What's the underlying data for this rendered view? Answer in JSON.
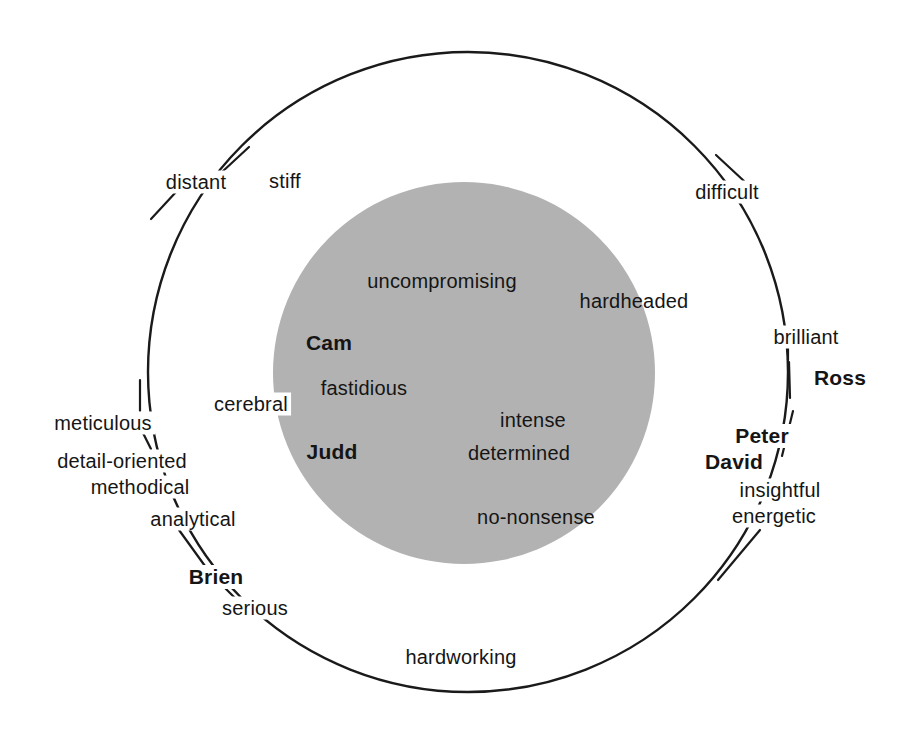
{
  "diagram": {
    "type": "venn-concentric",
    "outer_circle": {
      "name": "outer-ring",
      "cx": 468,
      "cy": 372,
      "r": 320,
      "stroke": "#1a1a1a",
      "stroke_width": 2.4,
      "fill": "none"
    },
    "inner_circle": {
      "name": "inner-core",
      "cx": 464,
      "cy": 373,
      "r": 191,
      "fill": "#b2b2b2",
      "stroke": "none"
    }
  },
  "inner_labels": [
    {
      "text": "uncompromising",
      "kind": "trait",
      "x": 442,
      "y": 281
    },
    {
      "text": "hardheaded",
      "kind": "trait",
      "x": 634,
      "y": 301
    },
    {
      "text": "Cam",
      "kind": "person",
      "x": 329,
      "y": 343
    },
    {
      "text": "fastidious",
      "kind": "trait",
      "x": 364,
      "y": 388
    },
    {
      "text": "intense",
      "kind": "trait",
      "x": 533,
      "y": 420
    },
    {
      "text": "Judd",
      "kind": "person",
      "x": 332,
      "y": 452
    },
    {
      "text": "determined",
      "kind": "trait",
      "x": 519,
      "y": 453
    },
    {
      "text": "no-nonsense",
      "kind": "trait",
      "x": 536,
      "y": 517
    }
  ],
  "ring_labels": [
    {
      "text": "distant",
      "kind": "trait",
      "x": 196,
      "y": 182
    },
    {
      "text": "stiff",
      "kind": "trait",
      "x": 285,
      "y": 181
    },
    {
      "text": "difficult",
      "kind": "trait",
      "x": 727,
      "y": 192
    },
    {
      "text": "brilliant",
      "kind": "trait",
      "x": 806,
      "y": 337
    },
    {
      "text": "Ross",
      "kind": "person",
      "x": 840,
      "y": 378
    },
    {
      "text": "cerebral",
      "kind": "trait",
      "x": 251,
      "y": 404
    },
    {
      "text": "meticulous",
      "kind": "trait",
      "x": 103,
      "y": 423
    },
    {
      "text": "Peter",
      "kind": "person",
      "x": 762,
      "y": 436
    },
    {
      "text": "detail-oriented",
      "kind": "trait",
      "x": 122,
      "y": 461
    },
    {
      "text": "David",
      "kind": "person",
      "x": 734,
      "y": 462
    },
    {
      "text": "methodical",
      "kind": "trait",
      "x": 140,
      "y": 487
    },
    {
      "text": "insightful",
      "kind": "trait",
      "x": 780,
      "y": 490
    },
    {
      "text": "analytical",
      "kind": "trait",
      "x": 193,
      "y": 519
    },
    {
      "text": "energetic",
      "kind": "trait",
      "x": 774,
      "y": 516
    },
    {
      "text": "Brien",
      "kind": "person",
      "x": 216,
      "y": 577
    },
    {
      "text": "serious",
      "kind": "trait",
      "x": 255,
      "y": 608
    },
    {
      "text": "hardworking",
      "kind": "trait",
      "x": 461,
      "y": 657
    }
  ],
  "leader_lines": [
    {
      "name": "leader-distant-up",
      "x1": 222,
      "y1": 172,
      "x2": 249,
      "y2": 147
    },
    {
      "name": "leader-distant-down",
      "x1": 176,
      "y1": 192,
      "x2": 151,
      "y2": 219
    },
    {
      "name": "leader-difficult",
      "x1": 744,
      "y1": 181,
      "x2": 716,
      "y2": 155
    },
    {
      "name": "leader-brilliant",
      "x1": 788,
      "y1": 347,
      "x2": 788,
      "y2": 360
    },
    {
      "name": "leader-ross",
      "x1": 789,
      "y1": 362,
      "x2": 790,
      "y2": 398
    },
    {
      "name": "leader-meticulous-up",
      "x1": 140,
      "y1": 411,
      "x2": 140,
      "y2": 380
    },
    {
      "name": "leader-meticulous-down",
      "x1": 143,
      "y1": 433,
      "x2": 151,
      "y2": 449
    },
    {
      "name": "leader-methodical",
      "x1": 179,
      "y1": 496,
      "x2": 167,
      "y2": 478
    },
    {
      "name": "leader-analytical",
      "x1": 179,
      "y1": 530,
      "x2": 205,
      "y2": 566
    },
    {
      "name": "leader-brien",
      "x1": 225,
      "y1": 588,
      "x2": 235,
      "y2": 598
    },
    {
      "name": "leader-peter",
      "x1": 793,
      "y1": 411,
      "x2": 782,
      "y2": 456
    },
    {
      "name": "leader-energetic",
      "x1": 760,
      "y1": 530,
      "x2": 718,
      "y2": 580
    }
  ],
  "colors": {
    "background": "#ffffff",
    "ink": "#151515",
    "inner_fill": "#b2b2b2",
    "outline": "#1a1a1a"
  }
}
